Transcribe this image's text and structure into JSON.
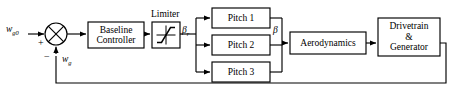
{
  "diagram": {
    "type": "control-block-diagram",
    "canvas": {
      "width": 457,
      "height": 95
    },
    "stroke_color": "#000000",
    "background_color": "#ffffff"
  },
  "signals": {
    "reference": {
      "name": "w_g0",
      "base": "w",
      "sub": "g0"
    },
    "feedback": {
      "name": "w_g",
      "base": "w",
      "sub": "g"
    },
    "pitch_reference": {
      "name": "beta_r",
      "base": "β",
      "sub": "r"
    },
    "pitch_actual": {
      "name": "beta",
      "base": "β",
      "sub": ""
    }
  },
  "summing_junction": {
    "name": "summing-junction",
    "plus_label": "+",
    "minus_label": "−",
    "cx": 56,
    "cy": 34,
    "r": 11
  },
  "blocks": [
    {
      "id": "baseline-controller",
      "label": "Baseline\nController",
      "x": 88,
      "y": 22,
      "w": 56,
      "h": 26
    },
    {
      "id": "limiter",
      "label": "",
      "x": 152,
      "y": 22,
      "w": 28,
      "h": 26,
      "caption": "Limiter",
      "icon": "saturation-curve"
    },
    {
      "id": "pitch-1",
      "label": "Pitch 1",
      "x": 212,
      "y": 8,
      "w": 58,
      "h": 20
    },
    {
      "id": "pitch-2",
      "label": "Pitch 2",
      "x": 212,
      "y": 35,
      "w": 58,
      "h": 20
    },
    {
      "id": "pitch-3",
      "label": "Pitch 3",
      "x": 212,
      "y": 62,
      "w": 58,
      "h": 20
    },
    {
      "id": "aerodynamics",
      "label": "Aerodynamics",
      "x": 290,
      "y": 32,
      "w": 76,
      "h": 22
    },
    {
      "id": "drivetrain-generator",
      "label": "Drivetrain\n&\nGenerator",
      "x": 378,
      "y": 18,
      "w": 62,
      "h": 38
    }
  ],
  "captions": {
    "limiter": "Limiter"
  },
  "feedback_path": {
    "name": "feedback-loop",
    "y": 83,
    "from_x": 446,
    "to_x": 56
  }
}
